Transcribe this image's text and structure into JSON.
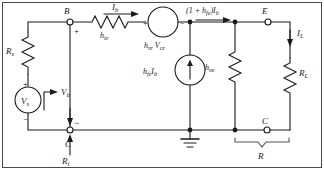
{
  "figure": {
    "type": "circuit-schematic",
    "line_color": "#1a1a1a",
    "background_color": "#ffffff",
    "border": true
  },
  "nodes": {
    "base_terminal": "B",
    "emitter_terminal": "E",
    "collector_terminal_left": "C",
    "collector_terminal_right": "C"
  },
  "components": {
    "source_resistance": "R",
    "source_resistance_sub": "s",
    "source_voltage": "V",
    "source_voltage_sub": "s",
    "input_resistance": "h",
    "input_resistance_sub": "ie",
    "feedback_source": "h",
    "feedback_source_sub": "re",
    "feedback_source_var": "V",
    "feedback_source_var_sub": "ce",
    "current_source": "h",
    "current_source_sub": "fe",
    "current_source_var": "I",
    "current_source_var_sub": "b",
    "output_conductance": "h",
    "output_conductance_sub": "oe",
    "load_resistance": "R",
    "load_resistance_sub": "L"
  },
  "labels": {
    "base_current": "I",
    "base_current_sub": "b",
    "emitter_current_prefix": "(1 + h",
    "emitter_current_sub": "fe",
    "emitter_current_mid": ")I",
    "emitter_current_sub2": "b",
    "load_current": "I",
    "load_current_sub": "L",
    "base_voltage": "V",
    "base_voltage_sub": "b",
    "input_impedance": "R",
    "input_impedance_sub": "i",
    "bracket_resistance": "R"
  },
  "polarity": {
    "plus": "+",
    "minus": "−"
  },
  "symbols": {
    "ground": "ground-symbol",
    "open_terminal": "open-circle-node",
    "junction": "filled-dot-node"
  }
}
